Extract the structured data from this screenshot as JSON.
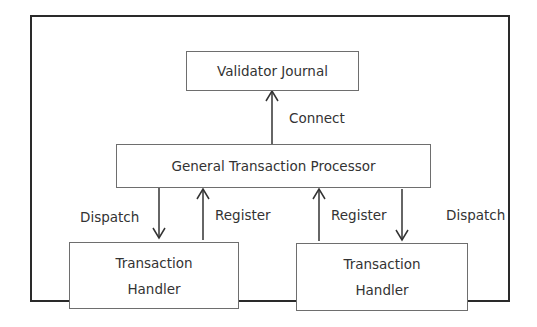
{
  "diagram": {
    "nodes": {
      "journal": {
        "label": "Validator Journal"
      },
      "processor": {
        "label": "General Transaction Processor"
      },
      "handler_left": {
        "line1": "Transaction",
        "line2": "Handler"
      },
      "handler_right": {
        "line1": "Transaction",
        "line2": "Handler"
      }
    },
    "edges": {
      "connect": {
        "label": "Connect",
        "from": "processor",
        "to": "journal"
      },
      "dispatch_left": {
        "label": "Dispatch",
        "from": "processor",
        "to": "handler_left"
      },
      "register_left": {
        "label": "Register",
        "from": "handler_left",
        "to": "processor"
      },
      "register_right": {
        "label": "Register",
        "from": "handler_right",
        "to": "processor"
      },
      "dispatch_right": {
        "label": "Dispatch",
        "from": "processor",
        "to": "handler_right"
      }
    }
  }
}
